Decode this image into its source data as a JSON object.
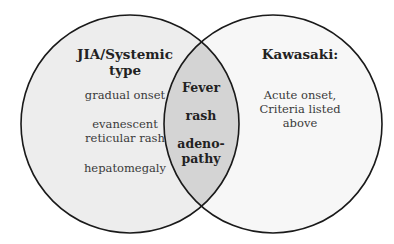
{
  "left_set": {
    "title": "JIA/Systemic type",
    "title_line1": "JIA/Systemic",
    "title_line2": "type",
    "items": [
      {
        "line1": "gradual onset"
      },
      {
        "line1": "evanescent",
        "line2": "reticular rash"
      },
      {
        "line1": "hepatomegaly"
      }
    ],
    "fill": "#ededed"
  },
  "right_set": {
    "title": "Kawasaki:",
    "text_line1": "Acute onset,",
    "text_line2": "Criteria listed",
    "text_line3": "above",
    "fill": "#f7f7f7"
  },
  "overlap": {
    "items": [
      "Fever",
      "rash",
      "adeno-",
      "pathy"
    ],
    "fill": "#d4d4d4"
  },
  "stroke": "#1a1a1a"
}
